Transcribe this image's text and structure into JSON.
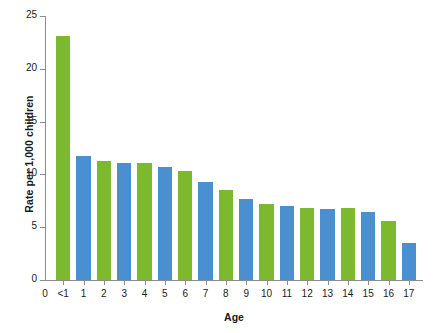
{
  "chart_data": {
    "type": "bar",
    "title": "",
    "xlabel": "Age",
    "ylabel": "Rate per 1,000 children",
    "categories": [
      "<1",
      "1",
      "2",
      "3",
      "4",
      "5",
      "6",
      "7",
      "8",
      "9",
      "10",
      "11",
      "12",
      "13",
      "14",
      "15",
      "16",
      "17"
    ],
    "values": [
      23.1,
      11.7,
      11.3,
      11.1,
      11.1,
      10.7,
      10.3,
      9.3,
      8.5,
      7.7,
      7.2,
      7.0,
      6.8,
      6.7,
      6.8,
      6.4,
      5.6,
      3.5
    ],
    "bar_colors": [
      "#7DB92E",
      "#4A8FD0",
      "#7DB92E",
      "#4A8FD0",
      "#7DB92E",
      "#4A8FD0",
      "#7DB92E",
      "#4A8FD0",
      "#7DB92E",
      "#4A8FD0",
      "#7DB92E",
      "#4A8FD0",
      "#7DB92E",
      "#4A8FD0",
      "#7DB92E",
      "#4A8FD0",
      "#7DB92E",
      "#4A8FD0"
    ],
    "ylim": [
      0,
      25
    ],
    "yticks": [
      0,
      5,
      10,
      15,
      20,
      25
    ],
    "ytick_labels": [
      "0",
      "5",
      "10",
      "15",
      "20",
      "25"
    ],
    "xtick_extra_origin_label": "0",
    "grid": false,
    "legend": null,
    "palette": {
      "green": "#7DB92E",
      "blue": "#4A8FD0",
      "axis": "#8c8c8c",
      "text": "#1b1b1b",
      "background": "#ffffff"
    }
  }
}
